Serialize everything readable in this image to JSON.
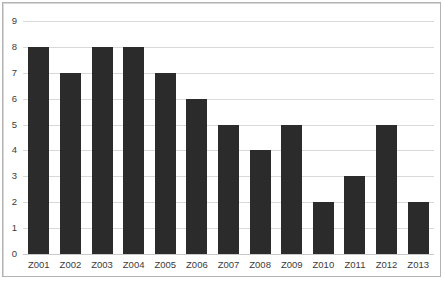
{
  "chart_data": {
    "type": "bar",
    "title": "",
    "subtitle": "",
    "xlabel": "",
    "ylabel": "",
    "categories": [
      "Z001",
      "Z002",
      "Z003",
      "Z004",
      "Z005",
      "Z006",
      "Z007",
      "Z008",
      "Z009",
      "Z010",
      "Z011",
      "Z012",
      "Z013"
    ],
    "values": [
      8,
      7,
      8,
      8,
      7,
      6,
      5,
      4,
      5,
      2,
      3,
      5,
      2
    ],
    "ylim": [
      0,
      9
    ],
    "ytick_labels": [
      "0",
      "1",
      "2",
      "3",
      "4",
      "5",
      "6",
      "7",
      "8",
      "9"
    ],
    "ytick_values": [
      0,
      1,
      2,
      3,
      4,
      5,
      6,
      7,
      8,
      9
    ],
    "grid": "horizontal",
    "legend": "none",
    "annotations": [],
    "colors": {
      "bar": "#2b2b2b",
      "gridline": "#d9d9d9",
      "baseline": "#c9c9c9",
      "border": "#b3b3b3",
      "background": "#ffffff",
      "tick_text": "#3b3b3b"
    }
  }
}
